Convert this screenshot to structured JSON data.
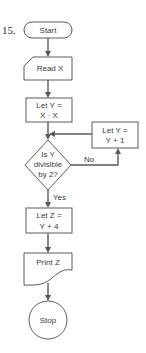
{
  "problem_number": "15.",
  "nodes": {
    "start": {
      "label": "Start"
    },
    "read": {
      "label": "Read X"
    },
    "let_y_xx": {
      "line1": "Let Y =",
      "line2": "X · X"
    },
    "decision": {
      "line1": "Is Y",
      "line2": "divisible",
      "line3": "by 2?"
    },
    "let_y_inc": {
      "line1": "Let Y =",
      "line2": "Y + 1"
    },
    "let_z": {
      "line1": "Let Z =",
      "line2": "Y + 4"
    },
    "print": {
      "label": "Print Z"
    },
    "stop": {
      "label": "Stop"
    }
  },
  "edges": {
    "no_label": "No",
    "yes_label": "Yes"
  },
  "colors": {
    "stroke": "#5a5a5a",
    "text": "#3a3a3a",
    "background": "#ffffff"
  }
}
